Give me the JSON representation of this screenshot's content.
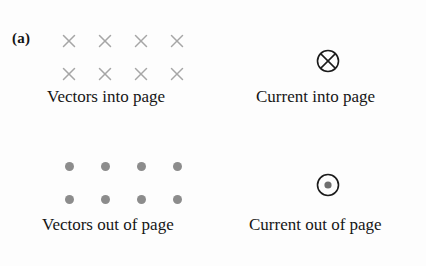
{
  "figure": {
    "panel_label": "(a)",
    "background_color": "#fdfdfd",
    "text_color": "#161616",
    "symbol_gray": "#a6a6a6",
    "dot_gray": "#8c8c8c",
    "circle_stroke": "#1b1b1b"
  },
  "quadrants": {
    "vectors_into_page": {
      "caption": "Vectors into page",
      "symbol": "x-mark",
      "symbol_name": "cross-into-page-icon",
      "rows": 2,
      "columns": 4,
      "count": 8
    },
    "current_into_page": {
      "caption": "Current into page",
      "symbol": "circle-cross",
      "symbol_name": "circle-cross-into-page-icon",
      "count": 1
    },
    "vectors_out_of_page": {
      "caption": "Vectors out of page",
      "symbol": "dot-mark",
      "symbol_name": "dot-out-of-page-icon",
      "rows": 2,
      "columns": 4,
      "count": 8
    },
    "current_out_of_page": {
      "caption": "Current out of page",
      "symbol": "circle-dot",
      "symbol_name": "circle-dot-out-of-page-icon",
      "count": 1
    }
  }
}
